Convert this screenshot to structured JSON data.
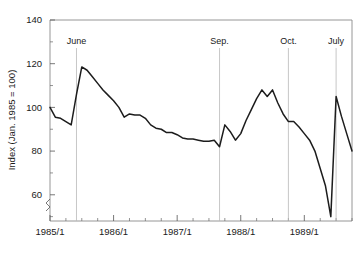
{
  "chart_data": {
    "type": "line",
    "title": "",
    "subtitle": "",
    "xlabel": "",
    "ylabel": "Index (Jan. 1985 = 100)",
    "ylim": [
      48,
      140
    ],
    "xlim": [
      "1985/1",
      "1989/10"
    ],
    "grid": false,
    "legend": "none",
    "y_ticks": [
      "60",
      "80",
      "100",
      "120",
      "140"
    ],
    "y_tick_values": [
      60,
      80,
      100,
      120,
      140
    ],
    "y_minor_ticks": [
      50,
      70,
      90,
      110,
      130
    ],
    "x_ticks": [
      "1985/1",
      "1986/1",
      "1987/1",
      "1988/1",
      "1989/1"
    ],
    "x_tick_values": [
      0,
      12,
      24,
      36,
      48
    ],
    "axis_break": true,
    "line_color": "#1c1c1c",
    "frame_color": "#8a8a8a",
    "rule_color": "#b9b9b9",
    "annotations": [
      {
        "label": "June",
        "x_index": 5,
        "value_at": 118.5
      },
      {
        "label": "Sep.",
        "x_index": 32,
        "value_at": 82
      },
      {
        "label": "Oct.",
        "x_index": 45,
        "value_at": 93.5
      },
      {
        "label": "July",
        "x_index": 54,
        "value_at": 105
      }
    ],
    "series": [
      {
        "name": "Index",
        "x": [
          "1985/1",
          "1985/2",
          "1985/3",
          "1985/4",
          "1985/5",
          "1985/6",
          "1985/7",
          "1985/8",
          "1985/9",
          "1985/10",
          "1985/11",
          "1985/12",
          "1986/1",
          "1986/2",
          "1986/3",
          "1986/4",
          "1986/5",
          "1986/6",
          "1986/7",
          "1986/8",
          "1986/9",
          "1986/10",
          "1986/11",
          "1986/12",
          "1987/1",
          "1987/2",
          "1987/3",
          "1987/4",
          "1987/5",
          "1987/6",
          "1987/7",
          "1987/8",
          "1987/9",
          "1987/10",
          "1987/11",
          "1987/12",
          "1988/1",
          "1988/2",
          "1988/3",
          "1988/4",
          "1988/5",
          "1988/6",
          "1988/7",
          "1988/8",
          "1988/9",
          "1988/10",
          "1988/11",
          "1988/12",
          "1989/1",
          "1989/2",
          "1989/3",
          "1989/4",
          "1989/5",
          "1989/6",
          "1989/7",
          "1989/8",
          "1989/9",
          "1989/10"
        ],
        "values": [
          100.0,
          95.5,
          95.0,
          93.5,
          92.0,
          106.0,
          118.5,
          117.0,
          114.0,
          111.0,
          108.0,
          105.5,
          103.0,
          100.0,
          95.5,
          97.0,
          96.5,
          96.5,
          95.0,
          92.0,
          90.5,
          90.0,
          88.5,
          88.5,
          87.5,
          86.0,
          85.5,
          85.5,
          85.0,
          84.5,
          84.5,
          85.0,
          82.0,
          92.0,
          89.0,
          85.0,
          88.0,
          94.0,
          99.0,
          104.0,
          108.0,
          105.0,
          108.0,
          102.0,
          97.0,
          93.5,
          93.5,
          91.0,
          88.0,
          85.0,
          80.0,
          72.0,
          64.0,
          50.0,
          105.0,
          96.0,
          88.0,
          80.0
        ]
      }
    ]
  }
}
